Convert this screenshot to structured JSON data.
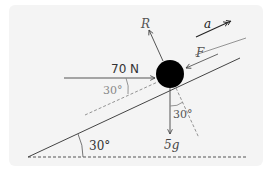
{
  "diagram": {
    "type": "free-body diagram on inclined plane",
    "labels": {
      "horizontal_force": "70 N",
      "normal_reaction": "R",
      "friction": "F",
      "acceleration": "a",
      "weight": "5g",
      "angle_horizontal_force": "30°",
      "angle_weight": "30°",
      "angle_incline": "30°"
    },
    "colors": {
      "panel_background": "#f4f4f4",
      "line": "#555555",
      "ball": "#000000",
      "dashed": "#777777",
      "angle_label": "#888888"
    }
  }
}
